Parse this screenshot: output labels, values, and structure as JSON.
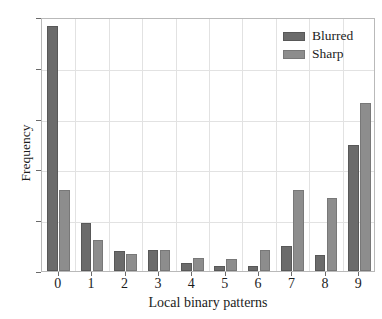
{
  "top_partial_text": "",
  "chart_data": {
    "type": "bar",
    "title": "",
    "xlabel": "Local binary patterns",
    "ylabel": "Frequency",
    "categories": [
      "0",
      "1",
      "2",
      "3",
      "4",
      "5",
      "6",
      "7",
      "8",
      "9"
    ],
    "series": [
      {
        "name": "Blurred",
        "color": "#6b6b6b",
        "values": [
          0.482,
          0.095,
          0.039,
          0.042,
          0.015,
          0.009,
          0.01,
          0.05,
          0.031,
          0.248
        ]
      },
      {
        "name": "Sharp",
        "color": "#8d8d8d",
        "values": [
          0.159,
          0.062,
          0.034,
          0.041,
          0.025,
          0.023,
          0.041,
          0.16,
          0.143,
          0.33
        ]
      }
    ],
    "ylim": [
      0.0,
      0.5
    ],
    "yticks": [
      "0.0",
      "0.1",
      "0.2",
      "0.3",
      "0.4",
      "0.5"
    ],
    "ytick_values": [
      0.0,
      0.1,
      0.2,
      0.3,
      0.4,
      0.5
    ],
    "grid": "both",
    "legend_position": "top-right"
  },
  "legend": {
    "entries": [
      {
        "label": "Blurred"
      },
      {
        "label": "Sharp"
      }
    ]
  }
}
